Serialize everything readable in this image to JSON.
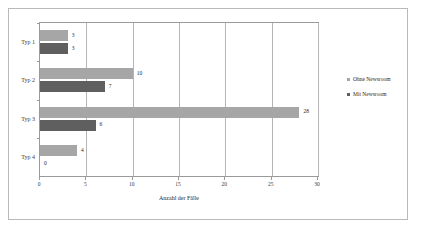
{
  "chart_data": {
    "type": "bar",
    "orientation": "horizontal",
    "title": "",
    "xlabel": "Anzahl der Fälle",
    "ylabel": "",
    "xlim": [
      0,
      30
    ],
    "xticks": [
      0,
      5,
      10,
      15,
      20,
      25,
      30
    ],
    "grid": true,
    "legend_position": "right",
    "categories": [
      "Typ 1",
      "Typ 2",
      "Typ 3",
      "Typ 4"
    ],
    "series": [
      {
        "name": "Ohne Newsroom",
        "color": "#a6a6a6",
        "values": [
          3,
          10,
          28,
          4
        ]
      },
      {
        "name": "Mit Newsroom",
        "color": "#5f5f5f",
        "values": [
          3,
          7,
          6,
          0
        ]
      }
    ]
  }
}
